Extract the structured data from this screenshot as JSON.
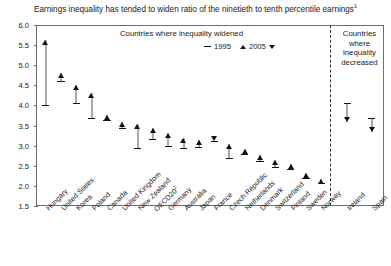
{
  "title": "Earnings inequality has tended to widen ratio of the ninetieth to tenth percentile earnings",
  "title_footnote": "1",
  "panels": {
    "left_header": "Countries where inequality widened",
    "right_header_lines": [
      "Countries",
      "where",
      "inequality",
      "decreased"
    ]
  },
  "legend": {
    "items": [
      {
        "label": "1995",
        "marker": "dash"
      },
      {
        "label": "2005",
        "marker": "triangle-up-down"
      }
    ]
  },
  "chart_data": {
    "type": "scatter",
    "title": "Earnings inequality has tended to widen ratio of the ninetieth to tenth percentile earnings",
    "xlabel": "",
    "ylabel": "",
    "ylim": [
      1.5,
      6.0
    ],
    "yticks": [
      "1.5",
      "2.0",
      "2.5",
      "3.0",
      "3.5",
      "4.0",
      "4.5",
      "5.0",
      "5.5",
      "6.0"
    ],
    "grid": false,
    "legend_position": "top-center",
    "categories": [
      "Hungary",
      "United States",
      "Korea",
      "Poland",
      "Canada",
      "United Kingdom",
      "New Zealand",
      "OECD20",
      "Germany",
      "Australia",
      "Japan",
      "France",
      "Czech Republic",
      "Netherlands",
      "Denmark",
      "Switzerland",
      "Finland",
      "Sweden",
      "Norway",
      "Ireland",
      "Spain"
    ],
    "category_footnotes": {
      "OECD20": "2"
    },
    "series": [
      {
        "name": "1995",
        "values": [
          4.0,
          4.6,
          4.05,
          3.7,
          3.63,
          3.45,
          2.93,
          3.17,
          3.0,
          2.95,
          2.96,
          3.11,
          2.7,
          2.8,
          2.62,
          2.46,
          2.43,
          2.2,
          2.07,
          4.07,
          3.7
        ]
      },
      {
        "name": "2005",
        "values": [
          5.62,
          4.8,
          4.5,
          4.3,
          3.76,
          3.6,
          3.55,
          3.43,
          3.32,
          3.2,
          3.15,
          3.11,
          3.05,
          2.92,
          2.78,
          2.65,
          2.54,
          2.32,
          2.18,
          3.6,
          3.33
        ]
      }
    ],
    "annotations": [
      "Left panel: countries where inequality widened (2005 above 1995)",
      "Right panel: countries where inequality decreased (2005 below 1995)"
    ]
  }
}
